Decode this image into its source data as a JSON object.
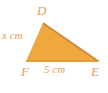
{
  "figure": {
    "type": "triangle-diagram",
    "background_color": "#ffffff",
    "fill_color": "#efa83e",
    "stroke_color_base": "#e79a3a",
    "stroke_color_hypotenuse": "#d2883c",
    "stroke_color_left": "#e8a04a",
    "label_color": "#e49c5e"
  },
  "vertices": {
    "D": {
      "label": "D",
      "x": 43,
      "y": 24
    },
    "F": {
      "label": "F",
      "x": 27,
      "y": 61
    },
    "E": {
      "label": "E",
      "x": 98,
      "y": 61
    }
  },
  "labels": {
    "vertex_d": "D",
    "vertex_f": "F",
    "vertex_e": "E",
    "side_df": "x cm",
    "side_fe": "5 cm"
  },
  "measurements": [
    {
      "side": "DF",
      "value": "x",
      "unit": "cm",
      "text": "x cm",
      "known": false
    },
    {
      "side": "FE",
      "value": "5",
      "unit": "cm",
      "text": "5 cm",
      "known": true
    }
  ]
}
